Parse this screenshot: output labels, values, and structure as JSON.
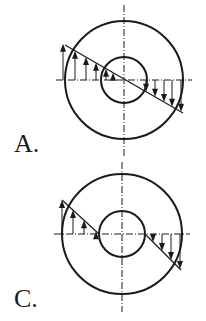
{
  "figures": [
    {
      "id": "A",
      "label": "A.",
      "label_pos": [
        14,
        131
      ],
      "center": [
        124,
        80
      ],
      "outer_radius": 59,
      "inner_radius": 23,
      "hline": [
        56,
        192
      ],
      "vline": [
        5,
        157
      ],
      "stress_line": [
        [
          65,
          45
        ],
        [
          183,
          113
        ]
      ],
      "stress_line_clipped_inside_hole": false,
      "up_arrows_x": [
        63,
        75,
        86,
        96,
        106,
        113
      ],
      "down_arrows_x": [
        146,
        155,
        164,
        172,
        181
      ],
      "description": "Linear stress distribution across full diameter (continuous through hole)"
    },
    {
      "id": "C",
      "label": "C.",
      "label_pos": [
        14,
        286
      ],
      "center": [
        122,
        234
      ],
      "outer_radius": 60,
      "inner_radius": 23,
      "hline": [
        54,
        190
      ],
      "vline": [
        162,
        312
      ],
      "stress_line": [
        [
          62,
          200
        ],
        [
          181,
          270
        ]
      ],
      "stress_line_clipped_inside_hole": true,
      "up_arrows_x": [
        62,
        73,
        84,
        96
      ],
      "down_arrows_x": [
        153,
        162,
        171,
        180
      ],
      "description": "Linear stress distribution only in material region (zero in hole)"
    }
  ],
  "colors": {
    "stroke": "#1a1a1a",
    "background": "#ffffff"
  }
}
